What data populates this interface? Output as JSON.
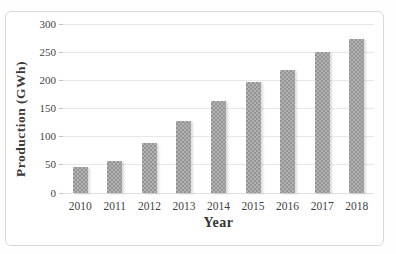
{
  "chart_data": {
    "type": "bar",
    "title": "",
    "categories": [
      "2010",
      "2011",
      "2012",
      "2013",
      "2014",
      "2015",
      "2016",
      "2017",
      "2018"
    ],
    "values": [
      45,
      57,
      88,
      128,
      163,
      196,
      219,
      251,
      273
    ],
    "xlabel": "Year",
    "ylabel": "Production (GWh)",
    "ylim": [
      0,
      300
    ],
    "ytick_step": 50,
    "yticks": [
      0,
      50,
      100,
      150,
      200,
      250,
      300
    ],
    "grid": true,
    "legend": "none",
    "colors": {
      "bar_fill_dark": "#949494",
      "bar_fill_light": "#b2b2b2",
      "gridline": "#e7e7e7",
      "frame_border": "#d8d8d8",
      "text": "#3a3a3a",
      "background": "#ffffff"
    }
  }
}
